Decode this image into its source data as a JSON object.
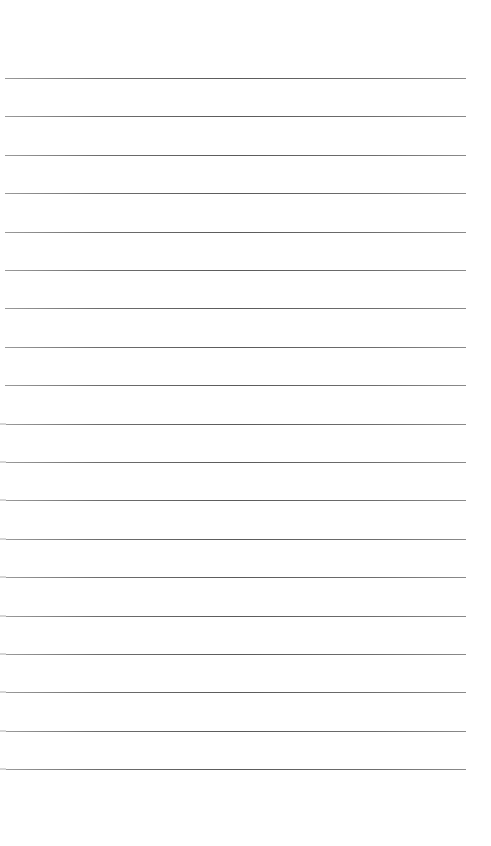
{
  "page": {
    "type": "lined-paper",
    "background_color": "#ffffff",
    "rule_color": "#5a5a5a",
    "rule_count": 19,
    "first_rule_y": 78,
    "rule_spacing": 38.4,
    "rule_left": 5,
    "rule_width": 461,
    "edge_marks_from_rule_index": 9,
    "text": ""
  }
}
